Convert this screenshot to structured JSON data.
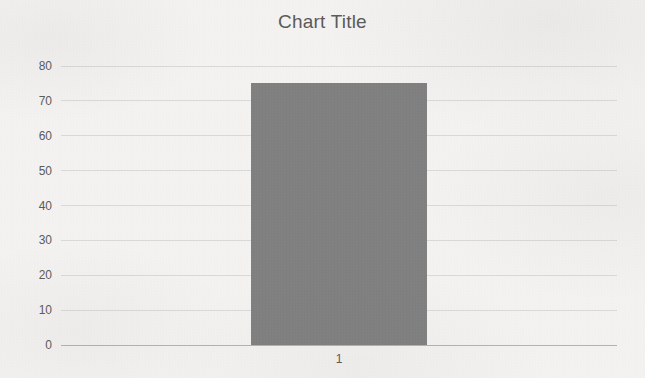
{
  "chart_data": {
    "type": "bar",
    "title": "Chart Title",
    "categories": [
      "1"
    ],
    "values": [
      75
    ],
    "xlabel": "",
    "ylabel": "",
    "ylim": [
      0,
      80
    ],
    "ytick_step": 10,
    "yticks": [
      0,
      10,
      20,
      30,
      40,
      50,
      60,
      70,
      80
    ],
    "grid": true,
    "legend": false,
    "colors": {
      "bar": "#7f7f7f",
      "gridline": "#d9d9d9",
      "axis_line": "#b3b3b3",
      "text": "#595959",
      "background": "#f4f3f1"
    }
  }
}
